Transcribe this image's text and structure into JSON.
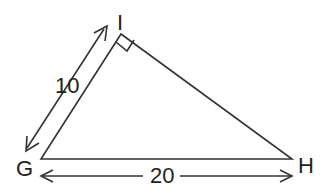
{
  "diagram": {
    "type": "right-triangle",
    "vertices": [
      {
        "name": "G",
        "label": "G"
      },
      {
        "name": "I",
        "label": "I"
      },
      {
        "name": "H",
        "label": "H"
      }
    ],
    "right_angle_at": "I",
    "sides": [
      {
        "between": "G-I",
        "label": "10"
      },
      {
        "between": "G-H",
        "label": "20"
      }
    ]
  }
}
